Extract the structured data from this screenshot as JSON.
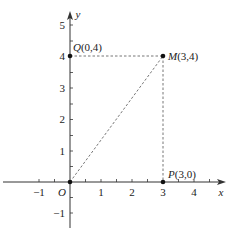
{
  "diagram": {
    "type": "coordinate-plane",
    "axes": {
      "x_label": "x",
      "y_label": "y",
      "origin_label": "O",
      "x_ticks": [
        {
          "value": -1,
          "label": "−1"
        },
        {
          "value": 1,
          "label": "1"
        },
        {
          "value": 2,
          "label": "2"
        },
        {
          "value": 3,
          "label": "3"
        },
        {
          "value": 4,
          "label": "4"
        }
      ],
      "y_ticks": [
        {
          "value": -1,
          "label": "−1"
        },
        {
          "value": 1,
          "label": "1"
        },
        {
          "value": 2,
          "label": "2"
        },
        {
          "value": 3,
          "label": "3"
        },
        {
          "value": 4,
          "label": "4"
        },
        {
          "value": 5,
          "label": "5"
        }
      ],
      "x_range": [
        -2,
        5
      ],
      "y_range": [
        -1.5,
        5.5
      ]
    },
    "points": [
      {
        "name": "Q",
        "coords": "(0,4)",
        "x": 0,
        "y": 4
      },
      {
        "name": "M",
        "coords": "(3,4)",
        "x": 3,
        "y": 4
      },
      {
        "name": "P",
        "coords": "(3,0)",
        "x": 3,
        "y": 0
      },
      {
        "name": "O",
        "coords": "",
        "x": 0,
        "y": 0
      }
    ],
    "dashed_segments": [
      {
        "from": "Q",
        "to": "M"
      },
      {
        "from": "M",
        "to": "P"
      },
      {
        "from": "O",
        "to": "M"
      }
    ],
    "colors": {
      "axis": "#333333",
      "dash": "#666666",
      "point": "#111111"
    }
  }
}
